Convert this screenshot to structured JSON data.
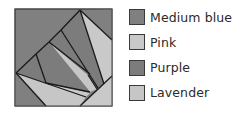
{
  "figure": {
    "type": "quilt-block-diagram",
    "colors": {
      "medium_blue": "#808080",
      "pink": "#c9c9c9",
      "purple": "#7c7c7c",
      "lavender": "#c6c6c6",
      "outline": "#1a1a1a"
    }
  },
  "legend": {
    "items": [
      {
        "label": "Medium blue",
        "color": "#808080"
      },
      {
        "label": "Pink",
        "color": "#c9c9c9"
      },
      {
        "label": "Purple",
        "color": "#7c7c7c"
      },
      {
        "label": "Lavender",
        "color": "#c6c6c6"
      }
    ]
  }
}
